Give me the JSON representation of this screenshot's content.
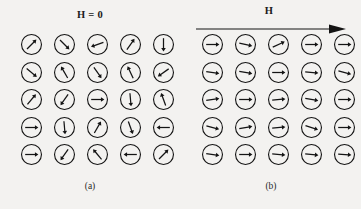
{
  "figure": {
    "background_color": "#f3f2f0",
    "ink_color": "#141414",
    "panels": [
      {
        "id": "a",
        "caption": "(a)",
        "field_label": "H = 0",
        "has_field_arrow": false,
        "grid": {
          "rows": 5,
          "cols": 5
        },
        "spin_angles_deg": [
          [
            45,
            -45,
            200,
            55,
            -90
          ],
          [
            -40,
            120,
            -55,
            115,
            215
          ],
          [
            50,
            235,
            0,
            -85,
            110
          ],
          [
            0,
            -85,
            60,
            -70,
            180
          ],
          [
            0,
            235,
            130,
            180,
            45
          ]
        ]
      },
      {
        "id": "b",
        "caption": "(b)",
        "field_label": "H",
        "has_field_arrow": true,
        "field_arrow_direction": "right",
        "grid": {
          "rows": 5,
          "cols": 5
        },
        "spin_angles_deg": [
          [
            0,
            -12,
            25,
            0,
            0
          ],
          [
            -8,
            -10,
            0,
            -5,
            -15
          ],
          [
            8,
            0,
            5,
            -10,
            0
          ],
          [
            -15,
            10,
            5,
            -18,
            0
          ],
          [
            -8,
            0,
            -5,
            -6,
            -4
          ]
        ]
      }
    ]
  }
}
